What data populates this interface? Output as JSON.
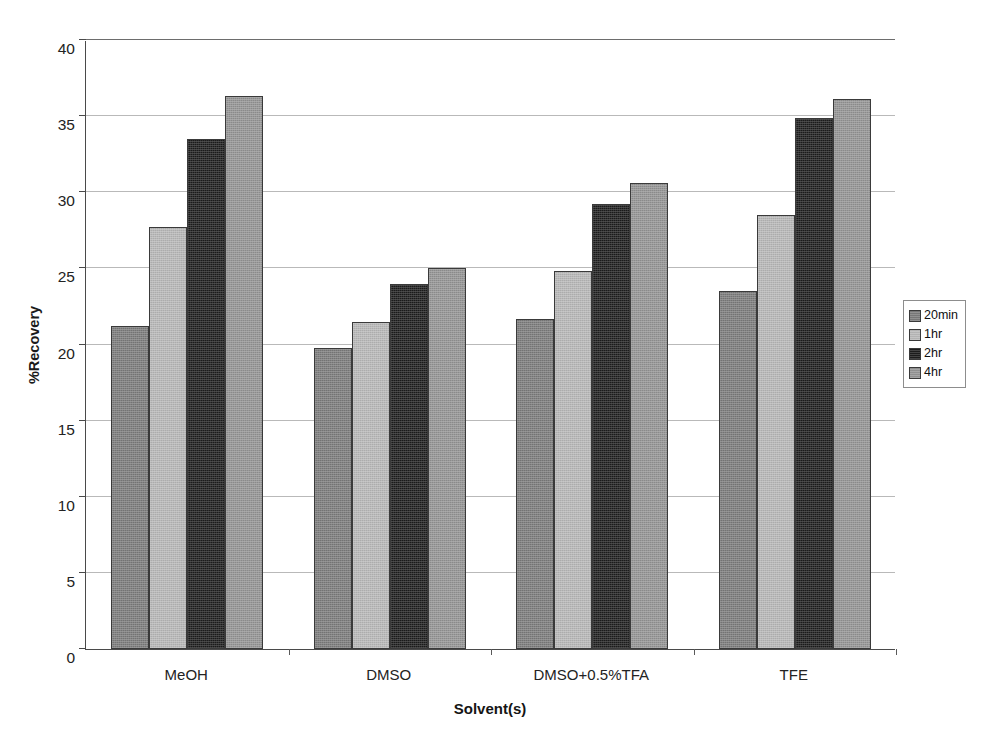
{
  "chart_data": {
    "type": "bar",
    "title": "",
    "subtitle": "",
    "xlabel": "Solvent(s)",
    "ylabel": "%Recovery",
    "categories": [
      "MeOH",
      "DMSO",
      "DMSO+0.5%TFA",
      "TFE"
    ],
    "series": [
      {
        "name": "20min",
        "values": [
          21.2,
          19.8,
          21.7,
          23.5
        ],
        "color": "#7b7b7b"
      },
      {
        "name": "1hr",
        "values": [
          27.7,
          21.5,
          24.8,
          28.5
        ],
        "color": "#b8b8b8"
      },
      {
        "name": "2hr",
        "values": [
          33.5,
          24.0,
          29.2,
          34.9
        ],
        "color": "#1d1d1d"
      },
      {
        "name": "4hr",
        "values": [
          36.3,
          25.0,
          30.6,
          36.1
        ],
        "color": "#949494"
      }
    ],
    "ylim": [
      0,
      40
    ],
    "yticks": [
      0,
      5,
      10,
      15,
      20,
      25,
      30,
      35,
      40
    ],
    "ytick_labels": [
      "0",
      "5",
      "10",
      "15",
      "20",
      "25",
      "30",
      "35",
      "40"
    ],
    "grid": true,
    "grid_axis": "y",
    "legend_position": "right",
    "legend_entries": [
      "20min",
      "1hr",
      "2hr",
      "4hr"
    ],
    "bar_orientation": "vertical",
    "background_color": "#ffffff",
    "axis_color": "#4a4a4a",
    "grid_color": "#b9b9b9"
  }
}
